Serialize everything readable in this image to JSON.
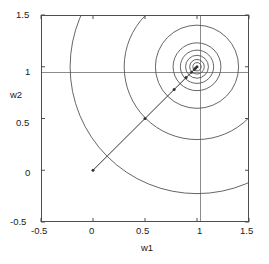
{
  "chart_data": {
    "type": "line",
    "title": "",
    "xlabel": "w1",
    "ylabel": "w2",
    "xlim": [
      -0.5,
      1.5
    ],
    "ylim": [
      -0.5,
      1.5
    ],
    "xticks": [
      -0.5,
      0,
      0.5,
      1,
      1.5
    ],
    "yticks": [
      -0.5,
      0,
      0.5,
      1,
      1.5
    ],
    "xticklabels": [
      "-0.5",
      "0",
      "0.5",
      "1",
      "1.5"
    ],
    "yticklabels": [
      "-0.5",
      "0",
      "0.5",
      "1",
      "1.5"
    ],
    "grid": false,
    "legend": null,
    "axis_box": true,
    "crosshair_lines": {
      "vertical_x": 1,
      "horizontal_y": 1,
      "color": "#808080"
    },
    "contours": {
      "description": "concentric circular level curves of the error surface",
      "center": [
        1.0,
        1.0
      ],
      "radii": [
        0.04,
        0.07,
        0.11,
        0.16,
        0.23,
        0.4,
        0.7,
        1.22
      ],
      "color": "#555555"
    },
    "trajectory": {
      "name": "weight update path",
      "color": "#333333",
      "marker": "dot",
      "points": [
        [
          0.0,
          0.0
        ],
        [
          0.5,
          0.5
        ],
        [
          0.78,
          0.78
        ],
        [
          0.895,
          0.895
        ],
        [
          0.948,
          0.948
        ],
        [
          0.974,
          0.974
        ],
        [
          0.987,
          0.987
        ],
        [
          1.0,
          1.0
        ]
      ]
    }
  },
  "axes": {
    "x_title": "w1",
    "y_title": "w2",
    "x_tick_labels": [
      "-0.5",
      "0",
      "0.5",
      "1",
      "1.5"
    ],
    "y_tick_labels": [
      "-0.5",
      "0",
      "0.5",
      "1",
      "1.5"
    ]
  },
  "colors": {
    "background": "#ffffff",
    "axis": "#4d4d4d",
    "contour": "#555555",
    "crosshair": "#8c8c8c",
    "trajectory": "#333333",
    "text": "#1a1a1a"
  }
}
